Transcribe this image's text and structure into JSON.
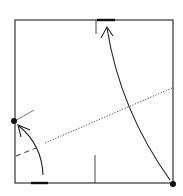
{
  "diagram": {
    "type": "origami-fold-step",
    "colors": {
      "line": "#333333",
      "paper": "#ffffff",
      "dot": "#111111"
    },
    "elements": [
      "square-paper",
      "valley-fold-line",
      "fold-arrow-large",
      "fold-arrow-small",
      "reference-point-left",
      "reference-point-bottom-right",
      "edge-mark-top",
      "edge-mark-bottom",
      "center-tick-top",
      "center-tick-bottom",
      "dashed-crease-left",
      "guide-tick-left"
    ]
  }
}
